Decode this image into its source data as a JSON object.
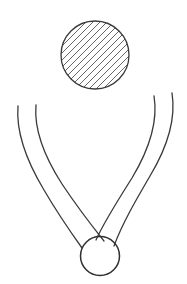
{
  "canvas": {
    "width": 187,
    "height": 284,
    "background_color": "#ffffff",
    "stroke_color": "#3a3a3a",
    "stroke_color_light": "#4a4a4a",
    "stroke_width": 1.3,
    "description": "Hand-drawn line diagram: a hatched circle above a pair of crossed curved arms holding a small open circle"
  },
  "shapes": {
    "hatched_circle": {
      "label": "hatched-ball",
      "cx": 95,
      "cy": 55,
      "r": 34,
      "fill": "none",
      "stroke": "#3a3a3a",
      "stroke_width": 1.3,
      "hatch": {
        "angle_deg": 45,
        "spacing": 7,
        "stroke": "#555555",
        "stroke_width": 0.9,
        "direction": "lower-left to upper-right"
      }
    },
    "open_circle": {
      "label": "gripped-ball",
      "cx": 100,
      "cy": 256,
      "r": 19.5,
      "fill": "none",
      "stroke": "#2f2f2f",
      "stroke_width": 1.5
    },
    "arms": [
      {
        "label": "left-arm-outer",
        "path": "M 18 106 C 16 130, 26 160, 44 190 C 58 214, 72 234, 82 248",
        "stroke": "#3a3a3a",
        "stroke_width": 1.3
      },
      {
        "label": "left-arm-inner",
        "path": "M 36 105 C 34 128, 44 156, 62 184 C 78 208, 92 226, 104 241",
        "stroke": "#3a3a3a",
        "stroke_width": 1.3
      },
      {
        "label": "right-arm-outer",
        "path": "M 172 93 C 176 118, 168 146, 150 176 C 136 200, 122 224, 114 246",
        "stroke": "#3a3a3a",
        "stroke_width": 1.3
      },
      {
        "label": "right-arm-inner",
        "path": "M 154 96 C 158 120, 150 148, 132 178 C 118 200, 104 222, 96 240",
        "stroke": "#3a3a3a",
        "stroke_width": 1.3
      }
    ],
    "crossing_point": {
      "label": "arm-crossing",
      "x": 97,
      "y": 215
    }
  },
  "meta": {
    "shape_count": 6
  }
}
